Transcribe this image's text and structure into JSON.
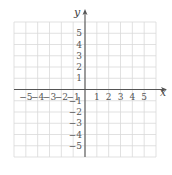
{
  "chart_data": {
    "type": "coordinate-grid",
    "title": "",
    "xlabel": "x",
    "ylabel": "y",
    "xlim": [
      -6,
      6
    ],
    "ylim": [
      -6,
      6
    ],
    "grid": true,
    "x_tick_labels": [
      "-5",
      "-4",
      "-3",
      "-2",
      "-1",
      "1",
      "2",
      "3",
      "4",
      "5"
    ],
    "y_tick_labels": [
      "5",
      "4",
      "3",
      "2",
      "1",
      "-1",
      "-2",
      "-3",
      "-4",
      "-5"
    ],
    "series": []
  },
  "colors": {
    "grid": "#d9d9d9",
    "axis": "#555555",
    "text": "#555555"
  }
}
